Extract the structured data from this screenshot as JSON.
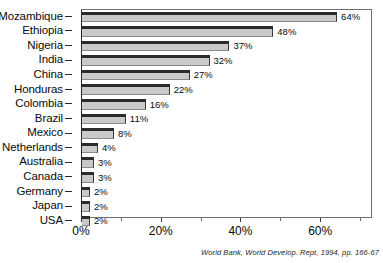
{
  "chart_data": {
    "type": "bar",
    "orientation": "horizontal",
    "title": "",
    "xlabel": "",
    "ylabel": "",
    "categories": [
      "Mozambique",
      "Ethiopia",
      "Nigeria",
      "India",
      "China",
      "Honduras",
      "Colombia",
      "Brazil",
      "Mexico",
      "Netherlands",
      "Australia",
      "Canada",
      "Germany",
      "Japan",
      "USA"
    ],
    "values": [
      64,
      48,
      37,
      32,
      27,
      22,
      16,
      11,
      8,
      4,
      3,
      3,
      2,
      2,
      2
    ],
    "value_labels": [
      "64%",
      "48%",
      "37%",
      "32%",
      "27%",
      "22%",
      "16%",
      "11%",
      "8%",
      "4%",
      "3%",
      "3%",
      "2%",
      "2%",
      "2%"
    ],
    "xlim": [
      0,
      73
    ],
    "xticks": [
      0,
      20,
      40,
      60
    ],
    "xtick_labels": [
      "0%",
      "20%",
      "40%",
      "60%"
    ],
    "xticks_minor": [
      10,
      30,
      50,
      70
    ],
    "grid": false,
    "legend": null,
    "bar_fill_color": "#c9c9c9",
    "bar_top_color": "#2b2b2b",
    "bar_edge_color": "#3a3a3a",
    "frame_color": "#6e6e6e",
    "text_color": "#0a0a0a"
  },
  "source_note": "World Bank, World Develop. Rept, 1994, pp. 166-67"
}
